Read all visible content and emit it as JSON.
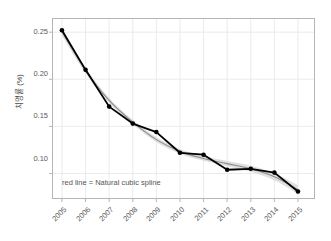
{
  "chart_data": {
    "type": "line",
    "title": "",
    "subtitle": "",
    "xlabel": "",
    "ylabel": "치명률 (%)",
    "categories": [
      "2005",
      "2006",
      "2007",
      "2008",
      "2009",
      "2010",
      "2011",
      "2012",
      "2013",
      "2014",
      "2015"
    ],
    "x": [
      2005,
      2006,
      2007,
      2008,
      2009,
      2010,
      2011,
      2012,
      2013,
      2014,
      2015
    ],
    "xlim": [
      2004.6,
      2015.7
    ],
    "ylim": [
      0.0735,
      0.2645
    ],
    "grid": true,
    "legend_position": "none",
    "series": [
      {
        "name": "observed",
        "style": "line-with-points",
        "color": "#000000",
        "values": [
          0.252,
          0.21,
          0.171,
          0.153,
          0.144,
          0.122,
          0.12,
          0.104,
          0.105,
          0.101,
          0.081
        ]
      },
      {
        "name": "Natural cubic spline",
        "style": "smooth-line",
        "color": "#8c8c8c",
        "values": [
          0.2505,
          0.2095,
          0.1775,
          0.1545,
          0.136,
          0.1235,
          0.116,
          0.1105,
          0.105,
          0.0965,
          0.083
        ]
      },
      {
        "name": "confidence band",
        "style": "ribbon",
        "color": "#d9d9d9",
        "lower": [
          0.2465,
          0.2065,
          0.1748,
          0.152,
          0.1335,
          0.121,
          0.1135,
          0.1078,
          0.1018,
          0.0928,
          0.0785
        ],
        "upper": [
          0.2545,
          0.2125,
          0.1802,
          0.157,
          0.1385,
          0.126,
          0.1185,
          0.1132,
          0.1082,
          0.1002,
          0.0875
        ]
      }
    ],
    "yticks": [
      0.1,
      0.15,
      0.2,
      0.25
    ],
    "ytick_labels": [
      "0.10",
      "0.15",
      "0.20",
      "0.25"
    ],
    "xticks": [
      2005,
      2006,
      2007,
      2008,
      2009,
      2010,
      2011,
      2012,
      2013,
      2014,
      2015
    ],
    "xtick_labels": [
      "2005",
      "2006",
      "2007",
      "2008",
      "2009",
      "2010",
      "2011",
      "2012",
      "2013",
      "2014",
      "2015"
    ],
    "annotations": [
      {
        "text": "red line = Natural cubic spline",
        "x": 2005.15,
        "y": 0.0885
      }
    ],
    "colors": {
      "line": "#000000",
      "point": "#000000",
      "spline": "#8c8c8c",
      "band": "#d9d9d9",
      "grid": "#e8e8ee",
      "frame": "#b5b5b5",
      "text": "#555555",
      "background": "#ffffff"
    }
  },
  "axis": {
    "ylabel": "치명률 (%)",
    "ytick_labels": [
      "0.25",
      "0.20",
      "0.15",
      "0.10"
    ],
    "xtick_labels": [
      "2005",
      "2006",
      "2007",
      "2008",
      "2009",
      "2010",
      "2011",
      "2012",
      "2013",
      "2014",
      "2015"
    ]
  },
  "annotation": {
    "spline_note": "red line = Natural cubic spline"
  }
}
